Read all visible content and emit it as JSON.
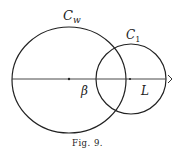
{
  "figure": {
    "caption": "Fig. 9.",
    "labels": {
      "big_circle": "C",
      "big_circle_sub": "w",
      "small_circle": "C",
      "small_circle_sub": "1",
      "left_intersection": "β",
      "right_point": "L",
      "arrow": "›"
    },
    "colors": {
      "stroke": "#222222",
      "background": "#ffffff"
    }
  }
}
